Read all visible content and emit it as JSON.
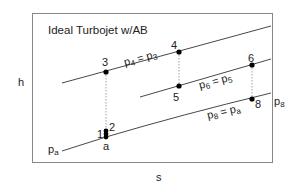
{
  "diagram": {
    "title": "Ideal Turbojet w/AB",
    "axes": {
      "x_label": "s",
      "y_label": "h"
    },
    "isobars": [
      {
        "id": "p4p3",
        "label_main": "p",
        "label_sub1": "4",
        "eq": " = p",
        "label_sub2": "3"
      },
      {
        "id": "p6p5",
        "label_main": "p",
        "label_sub1": "6",
        "eq": " = p",
        "label_sub2": "5"
      },
      {
        "id": "p8pa",
        "label_main": "p",
        "label_sub1": "8",
        "eq": " = p",
        "label_sub2": "a"
      }
    ],
    "end_labels": {
      "pa": {
        "main": "p",
        "sub": "a"
      },
      "p8": {
        "main": "p",
        "sub": "8"
      }
    },
    "points": [
      {
        "id": "1",
        "label": "1"
      },
      {
        "id": "2",
        "label": "2"
      },
      {
        "id": "a",
        "label": "a"
      },
      {
        "id": "3",
        "label": "3"
      },
      {
        "id": "4",
        "label": "4"
      },
      {
        "id": "5",
        "label": "5"
      },
      {
        "id": "6",
        "label": "6"
      },
      {
        "id": "8",
        "label": "8"
      }
    ],
    "colors": {
      "line": "#333333",
      "frame": "#888888",
      "dotted": "#999999",
      "point": "#000000"
    }
  }
}
